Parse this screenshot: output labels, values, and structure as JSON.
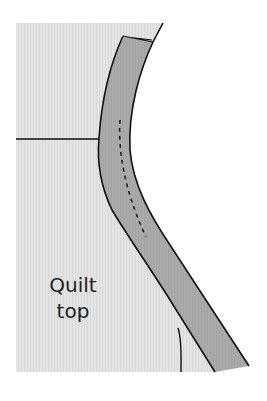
{
  "diagram": {
    "label_line1": "Quilt",
    "label_line2": "top",
    "colors": {
      "background": "#ffffff",
      "quilt_top": "#e3e3e3",
      "binding": "#a9a9a9",
      "stroke": "#111111"
    }
  }
}
